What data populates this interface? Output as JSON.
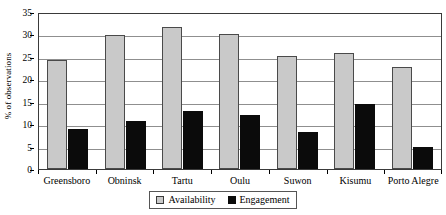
{
  "chart_data": {
    "type": "bar",
    "title": "",
    "xlabel": "",
    "ylabel": "% of observations",
    "ylim": [
      0,
      35
    ],
    "ytick_step": 5,
    "yticks": [
      0,
      5,
      10,
      15,
      20,
      25,
      30,
      35
    ],
    "grid": true,
    "legend_position": "bottom-center",
    "categories": [
      "Greensboro",
      "Obninsk",
      "Tartu",
      "Oulu",
      "Suwon",
      "Kisumu",
      "Porto Alegre"
    ],
    "series": [
      {
        "name": "Availability",
        "color": "#c9c9c9",
        "values": [
          24.4,
          29.8,
          31.7,
          30.2,
          25.3,
          25.8,
          22.8
        ]
      },
      {
        "name": "Engagement",
        "color": "#0b0b0b",
        "values": [
          8.9,
          10.7,
          12.9,
          12.1,
          8.2,
          14.5,
          4.8
        ]
      }
    ]
  },
  "legend": {
    "entries": [
      {
        "label": "Availability",
        "swatch": "availability"
      },
      {
        "label": "Engagement",
        "swatch": "engagement"
      }
    ]
  }
}
